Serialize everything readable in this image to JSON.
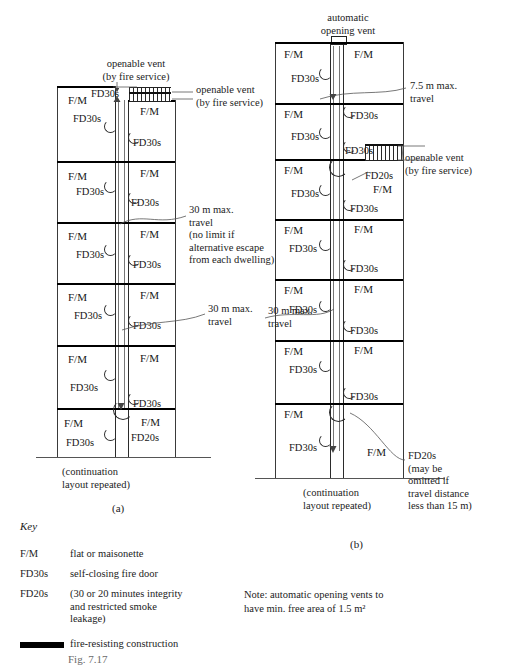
{
  "figure": {
    "caption_a": "(a)",
    "caption_b": "(b)",
    "bottom_caption": "Fig. 7.17"
  },
  "diagram_a": {
    "title_vent_top": "openable vent\n(by fire service)",
    "vent_right_label": "openable vent\n(by fire service)",
    "travel_note": "30 m max.\ntravel\n(no limit if\nalternative escape\nfrom each dwelling)",
    "travel_note_2": "30 m max.\ntravel",
    "continuation": "(continuation\nlayout repeated)",
    "floors": [
      {
        "left_unit": "F/M",
        "left_door": "FD30s",
        "right_unit": "F/M",
        "right_door": "FD30s"
      },
      {
        "left_unit": "F/M",
        "left_door": "FD30s",
        "right_unit": "F/M",
        "right_door": "FD30s"
      },
      {
        "left_unit": "F/M",
        "left_door": "FD30s",
        "right_unit": "F/M",
        "right_door": "FD30s"
      },
      {
        "left_unit": "F/M",
        "left_door": "FD30s",
        "right_unit": "F/M",
        "right_door": "FD30s"
      },
      {
        "left_unit": "F/M",
        "left_door": "FD30s",
        "right_unit": "F/M",
        "right_door": "FD30s"
      },
      {
        "left_unit": "F/M",
        "left_door": "FD30s",
        "right_unit": "F/M",
        "right_door": "FD20s"
      }
    ],
    "stair_door_label": "FD30s"
  },
  "diagram_b": {
    "title_vent_top": "automatic\nopening vent",
    "travel_note": "7.5 m max.\ntravel",
    "vent_right_label": "openable vent\n(by fire service)",
    "travel_note_2": "30 m max.\ntravel",
    "fd20s_callout": "FD20s\n(may be\nomitted if\ntravel distance\nless than 15 m)",
    "fd20s_mid_label": "FD20s",
    "continuation": "(continuation\nlayout repeated)",
    "floors": [
      {
        "left_unit": "F/M",
        "left_door": "FD30s",
        "right_unit": "F/M",
        "right_door": "FD30s"
      },
      {
        "left_unit": "F/M",
        "left_door": "FD30s",
        "right_unit": "F/M",
        "right_door": "FD30s"
      },
      {
        "left_unit": "F/M",
        "left_door": "FD30s",
        "right_unit": "F/M",
        "right_door": "FD30s"
      },
      {
        "left_unit": "F/M",
        "left_door": "FD30s",
        "right_unit": "F/M",
        "right_door": "FD30s"
      },
      {
        "left_unit": "F/M",
        "left_door": "FD30s",
        "right_unit": "F/M",
        "right_door": "FD30s"
      },
      {
        "left_unit": "F/M",
        "left_door": "FD30s",
        "right_unit": "F/M",
        "right_door": "FD30s"
      },
      {
        "left_unit": "F/M",
        "left_door": "FD30s",
        "right_unit": "F/M",
        "right_door": ""
      }
    ],
    "stair_door_label": "FD30s",
    "fm_extra_label": "F/M"
  },
  "key": {
    "title": "Key",
    "entries": [
      {
        "term": "F/M",
        "desc": "flat or maisonette"
      },
      {
        "term": "FD30s",
        "desc": "self-closing fire door"
      },
      {
        "term": "FD20s",
        "desc": "(30 or 20 minutes integrity\nand restricted smoke\nleakage)"
      },
      {
        "term": "",
        "desc": "fire-resisting construction"
      }
    ]
  },
  "note": {
    "text": "Note: automatic opening vents to\nhave min. free area of 1.5 m²"
  },
  "colors": {
    "ink": "#1a1a1a",
    "line": "#2a2a2a",
    "heavy": "#000000",
    "paper": "#ffffff"
  }
}
